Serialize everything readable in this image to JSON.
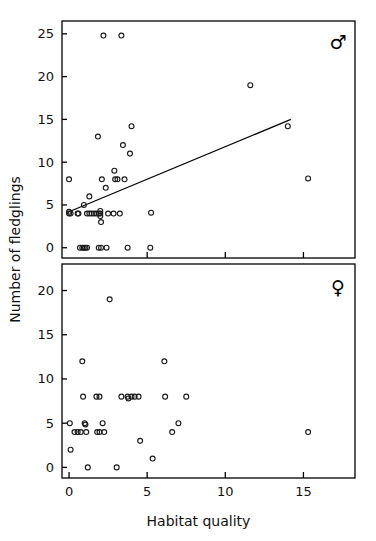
{
  "figure": {
    "type": "scatter-panels",
    "axis": {
      "x_label": "Habitat quality",
      "y_label": "Number of fledglings"
    },
    "panels": [
      {
        "id": "male",
        "symbol": "♂",
        "symbol_name": "male-symbol",
        "y_ticks": [
          0,
          5,
          10,
          15,
          20,
          25
        ],
        "y_tick_labels": [
          "0",
          "5",
          "10",
          "15",
          "20",
          "25"
        ],
        "ylim": [
          -1.2,
          26.5
        ],
        "has_regression_line": true
      },
      {
        "id": "female",
        "symbol": "♀",
        "symbol_name": "female-symbol",
        "y_ticks": [
          0,
          5,
          10,
          15,
          20
        ],
        "y_tick_labels": [
          "0",
          "5",
          "10",
          "15",
          "20"
        ],
        "ylim": [
          -1.2,
          23.0
        ],
        "has_regression_line": false
      }
    ],
    "x_ticks": [
      0,
      5,
      10,
      15
    ],
    "x_tick_labels": [
      "0",
      "5",
      "10",
      "15"
    ],
    "xlim": [
      -0.45,
      18.3
    ],
    "marker": "open-circle",
    "marker_color": "#1a1a1a"
  },
  "chart_data": [
    {
      "type": "scatter",
      "title": "",
      "panel": "male",
      "legend": "♂",
      "xlabel": "Habitat quality",
      "ylabel": "Number of fledglings",
      "xlim": [
        -0.45,
        18.3
      ],
      "ylim": [
        -1.2,
        26.5
      ],
      "grid": false,
      "xticks": [
        0,
        5,
        10,
        15
      ],
      "yticks": [
        0,
        5,
        10,
        15,
        20,
        25
      ],
      "points": [
        [
          0.0,
          8.0
        ],
        [
          0.0,
          4.0
        ],
        [
          0.0,
          4.2
        ],
        [
          0.1,
          4.0
        ],
        [
          0.55,
          4.0
        ],
        [
          0.6,
          4.0
        ],
        [
          0.95,
          5.0
        ],
        [
          1.15,
          4.0
        ],
        [
          1.3,
          4.0
        ],
        [
          1.45,
          4.0
        ],
        [
          1.3,
          6.0
        ],
        [
          1.6,
          4.0
        ],
        [
          1.75,
          4.0
        ],
        [
          1.9,
          4.0
        ],
        [
          1.85,
          13.0
        ],
        [
          2.0,
          4.0
        ],
        [
          2.0,
          4.3
        ],
        [
          2.0,
          3.7
        ],
        [
          2.05,
          3.0
        ],
        [
          2.1,
          8.0
        ],
        [
          2.2,
          24.8
        ],
        [
          2.35,
          7.0
        ],
        [
          2.5,
          4.0
        ],
        [
          2.85,
          4.0
        ],
        [
          2.9,
          9.0
        ],
        [
          2.95,
          8.0
        ],
        [
          3.1,
          8.0
        ],
        [
          3.25,
          4.0
        ],
        [
          3.35,
          24.8
        ],
        [
          3.45,
          12.0
        ],
        [
          3.55,
          8.0
        ],
        [
          3.75,
          0.0
        ],
        [
          3.9,
          11.0
        ],
        [
          4.0,
          14.2
        ],
        [
          0.7,
          0.0
        ],
        [
          0.85,
          0.0
        ],
        [
          0.95,
          0.0
        ],
        [
          1.05,
          0.0
        ],
        [
          1.15,
          0.0
        ],
        [
          1.9,
          0.0
        ],
        [
          2.05,
          0.0
        ],
        [
          2.4,
          0.0
        ],
        [
          5.25,
          4.1
        ],
        [
          5.2,
          0.0
        ],
        [
          11.6,
          19.0
        ],
        [
          14.0,
          14.2
        ],
        [
          15.3,
          8.1
        ]
      ],
      "regression_line": {
        "x": [
          0.0,
          14.2
        ],
        "y": [
          4.2,
          15.0
        ]
      }
    },
    {
      "type": "scatter",
      "title": "",
      "panel": "female",
      "legend": "♀",
      "xlabel": "Habitat quality",
      "ylabel": "Number of fledglings",
      "xlim": [
        -0.45,
        18.3
      ],
      "ylim": [
        -1.2,
        23.0
      ],
      "grid": false,
      "xticks": [
        0,
        5,
        10,
        15
      ],
      "yticks": [
        0,
        5,
        10,
        15,
        20
      ],
      "points": [
        [
          0.05,
          5.0
        ],
        [
          0.1,
          2.0
        ],
        [
          0.35,
          4.0
        ],
        [
          0.55,
          4.0
        ],
        [
          0.75,
          4.0
        ],
        [
          0.85,
          12.0
        ],
        [
          0.9,
          8.0
        ],
        [
          1.0,
          5.0
        ],
        [
          1.05,
          4.85
        ],
        [
          1.1,
          4.0
        ],
        [
          1.2,
          0.0
        ],
        [
          1.75,
          8.0
        ],
        [
          1.95,
          8.0
        ],
        [
          1.8,
          4.0
        ],
        [
          1.95,
          4.0
        ],
        [
          2.15,
          5.0
        ],
        [
          2.25,
          4.0
        ],
        [
          2.6,
          19.0
        ],
        [
          3.05,
          0.0
        ],
        [
          3.35,
          8.0
        ],
        [
          3.75,
          8.0
        ],
        [
          3.8,
          7.8
        ],
        [
          4.0,
          8.0
        ],
        [
          4.2,
          8.0
        ],
        [
          4.45,
          8.0
        ],
        [
          4.55,
          3.0
        ],
        [
          5.35,
          1.0
        ],
        [
          6.1,
          12.0
        ],
        [
          6.15,
          8.0
        ],
        [
          6.6,
          4.0
        ],
        [
          7.0,
          5.0
        ],
        [
          7.5,
          8.0
        ],
        [
          15.3,
          4.0
        ]
      ]
    }
  ]
}
